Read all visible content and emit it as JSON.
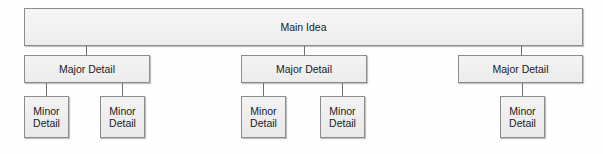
{
  "diagram": {
    "type": "hierarchy-tree",
    "colors": {
      "node_fill": "#f1f1f1",
      "node_border": "#8c8c8c",
      "connector": "#6f6f6f",
      "text": "#1a1a1a",
      "background": "#ffffff"
    },
    "root": {
      "label": "Main Idea"
    },
    "branches": [
      {
        "label": "Major Detail",
        "children": [
          {
            "line1": "Minor",
            "line2": "Detail"
          },
          {
            "line1": "Minor",
            "line2": "Detail"
          }
        ]
      },
      {
        "label": "Major Detail",
        "children": [
          {
            "line1": "Minor",
            "line2": "Detail"
          },
          {
            "line1": "Minor",
            "line2": "Detail"
          }
        ]
      },
      {
        "label": "Major Detail",
        "children": [
          {
            "line1": "Minor",
            "line2": "Detail"
          }
        ]
      }
    ]
  }
}
